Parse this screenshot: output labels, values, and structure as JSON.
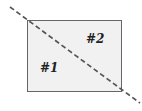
{
  "diagram": {
    "region_labels": [
      "#1",
      "#2"
    ],
    "rect": {
      "x": 27,
      "y": 20,
      "w": 94,
      "h": 71,
      "fill": "#f1f1f1",
      "stroke": "#555555"
    },
    "line": {
      "x1": 10,
      "y1": 7,
      "x2": 140,
      "y2": 103,
      "stroke": "#555555",
      "dash": "5,3"
    }
  }
}
